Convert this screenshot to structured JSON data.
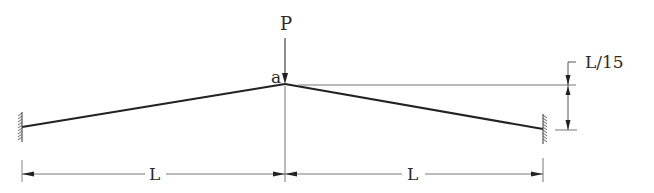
{
  "diagram": {
    "type": "structural-beam-diagram",
    "labels": {
      "load": "P",
      "apex": "a",
      "rise": "L/15",
      "span_left": "L",
      "span_right": "L"
    },
    "colors": {
      "beam": "#222222",
      "dimension": "#555555",
      "background": "#ffffff"
    },
    "nodes": [
      {
        "id": "left-support",
        "type": "fixed",
        "x": 22,
        "y": 127
      },
      {
        "id": "apex-a",
        "type": "joint",
        "x": 285,
        "y": 84
      },
      {
        "id": "right-support",
        "type": "fixed",
        "x": 543,
        "y": 129
      }
    ],
    "members": [
      {
        "from": "left-support",
        "to": "apex-a"
      },
      {
        "from": "apex-a",
        "to": "right-support"
      }
    ],
    "loads": [
      {
        "label": "P",
        "at": "apex-a",
        "direction": "down"
      }
    ]
  }
}
